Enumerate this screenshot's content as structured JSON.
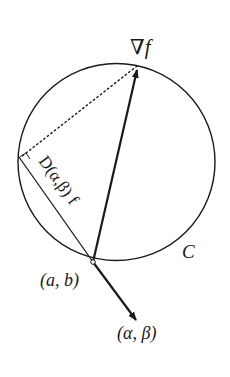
{
  "figure": {
    "labels": {
      "gradient": "∇f",
      "directional_derivative": "D(α,β) f",
      "point": "(a, b)",
      "direction": "(α, β)",
      "circle": "C"
    },
    "colors": {
      "stroke": "#1a1a1a",
      "background": "#ffffff"
    }
  }
}
